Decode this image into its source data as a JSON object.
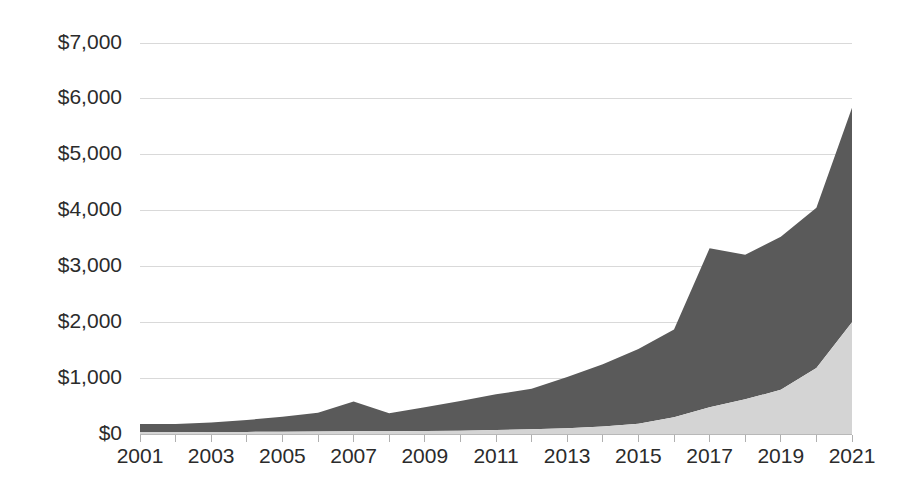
{
  "chart_data": {
    "type": "area",
    "stacked": true,
    "title": "",
    "subtitle": "",
    "xlabel": "",
    "ylabel": "",
    "grid": true,
    "legend_position": "none",
    "x": [
      2001,
      2002,
      2003,
      2004,
      2005,
      2006,
      2007,
      2008,
      2009,
      2010,
      2011,
      2012,
      2013,
      2014,
      2015,
      2016,
      2017,
      2018,
      2019,
      2020,
      2021
    ],
    "xlim": [
      2001,
      2021
    ],
    "ylim": [
      0,
      7000
    ],
    "ytick_values": [
      0,
      1000,
      2000,
      3000,
      4000,
      5000,
      6000,
      7000
    ],
    "ytick_labels": [
      "$0",
      "$1,000",
      "$2,000",
      "$3,000",
      "$4,000",
      "$5,000",
      "$6,000",
      "$7,000"
    ],
    "xtick_values": [
      2001,
      2003,
      2005,
      2007,
      2009,
      2011,
      2013,
      2015,
      2017,
      2019,
      2021
    ],
    "xtick_labels": [
      "2001",
      "2003",
      "2005",
      "2007",
      "2009",
      "2011",
      "2013",
      "2015",
      "2017",
      "2019",
      "2021"
    ],
    "xtick_minor_values": [
      2002,
      2004,
      2006,
      2008,
      2010,
      2012,
      2014,
      2016,
      2018,
      2020
    ],
    "series": [
      {
        "name": "lower-series",
        "color": "#d4d4d4",
        "values": [
          30,
          32,
          35,
          38,
          42,
          46,
          50,
          48,
          52,
          58,
          70,
          85,
          105,
          135,
          185,
          300,
          480,
          620,
          790,
          1180,
          2000
        ]
      },
      {
        "name": "upper-series",
        "color": "#5a5a5a",
        "values": [
          150,
          148,
          170,
          212,
          268,
          334,
          530,
          322,
          428,
          532,
          640,
          725,
          915,
          1115,
          1335,
          1570,
          2845,
          2590,
          2740,
          2870,
          3840
        ]
      }
    ],
    "totals": [
      180,
      180,
      205,
      250,
      310,
      380,
      580,
      370,
      480,
      590,
      710,
      810,
      1020,
      1250,
      1520,
      1870,
      3325,
      3210,
      3530,
      4050,
      5840
    ],
    "annotations": []
  },
  "colors": {
    "series_dark": "#5a5a5a",
    "series_light": "#d4d4d4",
    "gridline": "#d9d9d9",
    "axis": "#b8b8b8",
    "text": "#2b2b2b",
    "background": "#ffffff"
  },
  "plot_geometry": {
    "left": 140,
    "right": 852,
    "top": 43,
    "bottom": 434
  }
}
